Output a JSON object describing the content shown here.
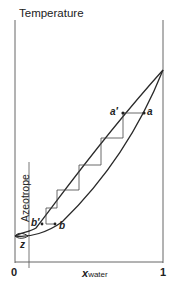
{
  "diagram": {
    "y_axis_label": "Temperature",
    "x_axis_label": "x",
    "x_axis_subscript": "water",
    "x_ticks": [
      "0",
      "1"
    ],
    "azeotrope_label": "Azeotrope",
    "points": {
      "a_prime": "a′",
      "a": "a",
      "b_prime": "b′",
      "b": "b",
      "z": "z"
    },
    "colors": {
      "line": "#2a2a2a",
      "axis": "#555555",
      "background": "#ffffff"
    }
  }
}
